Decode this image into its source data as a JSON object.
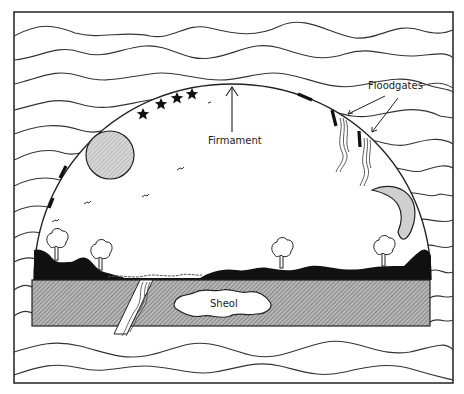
{
  "labels": {
    "firmament": "Firmament",
    "floodgates": "Floodgates",
    "sheol": "Sheol"
  },
  "elements": {
    "frame": "outer-border",
    "waters_above": "upper-waters",
    "waters_below": "lower-waters",
    "dome": "firmament-dome",
    "sun": "sun",
    "moon": "crescent-moon",
    "stars_count": 4,
    "birds_count": 4,
    "trees_count": 4,
    "floodgates_count": 2
  },
  "colors": {
    "line": "#222222",
    "hatch": "#9a9a9a",
    "sun_fill": "#c8c8c8",
    "moon_fill": "#cfcfcf",
    "land": "#111111",
    "background": "#ffffff"
  }
}
